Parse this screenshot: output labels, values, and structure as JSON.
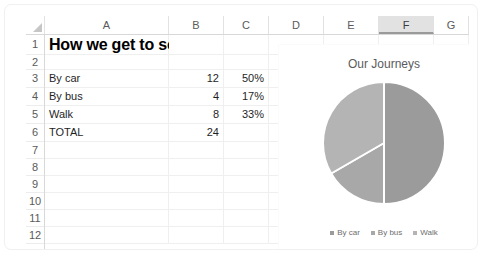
{
  "spreadsheet": {
    "columns": [
      "A",
      "B",
      "C",
      "D",
      "E",
      "F",
      "G"
    ],
    "selected_column": "F",
    "rows": [
      "1",
      "2",
      "3",
      "4",
      "5",
      "6",
      "7",
      "8",
      "9",
      "10",
      "11",
      "12"
    ],
    "title_cell": "How we get to school",
    "data_rows": [
      {
        "label": "By car",
        "count": "12",
        "percent": "50%"
      },
      {
        "label": "By bus",
        "count": "4",
        "percent": "17%"
      },
      {
        "label": "Walk",
        "count": "8",
        "percent": "33%"
      }
    ],
    "total_label": "TOTAL",
    "total_count": "24"
  },
  "chart_data": {
    "type": "pie",
    "title": "Our Journeys",
    "categories": [
      "By car",
      "By bus",
      "Walk"
    ],
    "values": [
      12,
      4,
      8
    ],
    "percents": [
      50,
      17,
      33
    ],
    "colors": [
      "#9b9b9b",
      "#a8a8a8",
      "#b4b4b4"
    ],
    "legend_position": "bottom",
    "grid": false,
    "xlabel": "",
    "ylabel": ""
  }
}
